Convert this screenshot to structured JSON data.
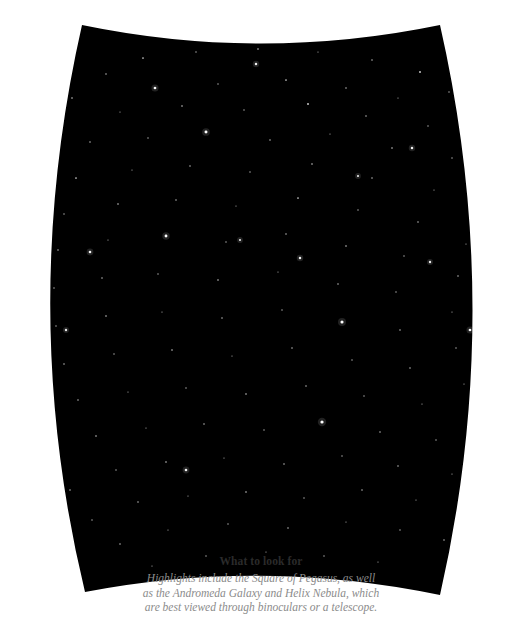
{
  "chart_data": {
    "type": "scatter",
    "title": "",
    "xlabel": "",
    "ylabel": "",
    "background_color": "#000000",
    "star_color": "#ffffff",
    "page_background": "#ffffff",
    "grid": false,
    "legend": "none",
    "projection_shape": "barrel",
    "xlim": [
      0,
      522
    ],
    "ylim": [
      0,
      623
    ],
    "stars": [
      {
        "x": 143,
        "y": 58,
        "mag": 1.4
      },
      {
        "x": 196,
        "y": 52,
        "mag": 1.1
      },
      {
        "x": 258,
        "y": 49,
        "mag": 1.3
      },
      {
        "x": 318,
        "y": 52,
        "mag": 1.0
      },
      {
        "x": 372,
        "y": 60,
        "mag": 1.2
      },
      {
        "x": 420,
        "y": 72,
        "mag": 1.5
      },
      {
        "x": 106,
        "y": 74,
        "mag": 1.2
      },
      {
        "x": 449,
        "y": 92,
        "mag": 1.1
      },
      {
        "x": 72,
        "y": 98,
        "mag": 1.3
      },
      {
        "x": 155,
        "y": 88,
        "mag": 2.2
      },
      {
        "x": 218,
        "y": 84,
        "mag": 1.1
      },
      {
        "x": 286,
        "y": 80,
        "mag": 1.4
      },
      {
        "x": 346,
        "y": 88,
        "mag": 1.2
      },
      {
        "x": 398,
        "y": 98,
        "mag": 1.0
      },
      {
        "x": 472,
        "y": 118,
        "mag": 1.2
      },
      {
        "x": 52,
        "y": 128,
        "mag": 1.1
      },
      {
        "x": 120,
        "y": 112,
        "mag": 1.0
      },
      {
        "x": 182,
        "y": 106,
        "mag": 1.3
      },
      {
        "x": 244,
        "y": 110,
        "mag": 1.1
      },
      {
        "x": 308,
        "y": 104,
        "mag": 1.5
      },
      {
        "x": 366,
        "y": 116,
        "mag": 1.2
      },
      {
        "x": 428,
        "y": 126,
        "mag": 1.1
      },
      {
        "x": 486,
        "y": 146,
        "mag": 1.0
      },
      {
        "x": 38,
        "y": 160,
        "mag": 1.3
      },
      {
        "x": 90,
        "y": 142,
        "mag": 1.2
      },
      {
        "x": 148,
        "y": 138,
        "mag": 1.1
      },
      {
        "x": 206,
        "y": 132,
        "mag": 2.4
      },
      {
        "x": 270,
        "y": 140,
        "mag": 1.2
      },
      {
        "x": 330,
        "y": 134,
        "mag": 1.0
      },
      {
        "x": 392,
        "y": 148,
        "mag": 1.3
      },
      {
        "x": 452,
        "y": 158,
        "mag": 1.1
      },
      {
        "x": 496,
        "y": 182,
        "mag": 1.2
      },
      {
        "x": 28,
        "y": 196,
        "mag": 1.1
      },
      {
        "x": 76,
        "y": 178,
        "mag": 1.4
      },
      {
        "x": 132,
        "y": 170,
        "mag": 1.0
      },
      {
        "x": 190,
        "y": 166,
        "mag": 1.2
      },
      {
        "x": 250,
        "y": 172,
        "mag": 1.1
      },
      {
        "x": 312,
        "y": 164,
        "mag": 1.3
      },
      {
        "x": 372,
        "y": 178,
        "mag": 1.2
      },
      {
        "x": 434,
        "y": 190,
        "mag": 1.0
      },
      {
        "x": 478,
        "y": 212,
        "mag": 1.1
      },
      {
        "x": 24,
        "y": 234,
        "mag": 1.2
      },
      {
        "x": 64,
        "y": 214,
        "mag": 1.1
      },
      {
        "x": 118,
        "y": 204,
        "mag": 1.3
      },
      {
        "x": 176,
        "y": 200,
        "mag": 1.2
      },
      {
        "x": 236,
        "y": 206,
        "mag": 1.0
      },
      {
        "x": 298,
        "y": 198,
        "mag": 1.4
      },
      {
        "x": 358,
        "y": 210,
        "mag": 1.1
      },
      {
        "x": 418,
        "y": 222,
        "mag": 1.2
      },
      {
        "x": 466,
        "y": 244,
        "mag": 1.0
      },
      {
        "x": 22,
        "y": 272,
        "mag": 1.1
      },
      {
        "x": 58,
        "y": 250,
        "mag": 1.2
      },
      {
        "x": 108,
        "y": 240,
        "mag": 1.0
      },
      {
        "x": 166,
        "y": 236,
        "mag": 2.3
      },
      {
        "x": 226,
        "y": 242,
        "mag": 1.1
      },
      {
        "x": 286,
        "y": 234,
        "mag": 1.2
      },
      {
        "x": 346,
        "y": 246,
        "mag": 1.3
      },
      {
        "x": 404,
        "y": 256,
        "mag": 1.1
      },
      {
        "x": 458,
        "y": 276,
        "mag": 1.2
      },
      {
        "x": 20,
        "y": 310,
        "mag": 1.0
      },
      {
        "x": 54,
        "y": 288,
        "mag": 1.1
      },
      {
        "x": 102,
        "y": 278,
        "mag": 1.2
      },
      {
        "x": 158,
        "y": 274,
        "mag": 1.1
      },
      {
        "x": 218,
        "y": 280,
        "mag": 1.3
      },
      {
        "x": 278,
        "y": 272,
        "mag": 1.0
      },
      {
        "x": 338,
        "y": 284,
        "mag": 1.2
      },
      {
        "x": 396,
        "y": 292,
        "mag": 1.1
      },
      {
        "x": 452,
        "y": 312,
        "mag": 1.0
      },
      {
        "x": 22,
        "y": 348,
        "mag": 1.2
      },
      {
        "x": 56,
        "y": 326,
        "mag": 1.1
      },
      {
        "x": 106,
        "y": 316,
        "mag": 1.3
      },
      {
        "x": 162,
        "y": 312,
        "mag": 1.0
      },
      {
        "x": 222,
        "y": 318,
        "mag": 1.2
      },
      {
        "x": 282,
        "y": 310,
        "mag": 1.1
      },
      {
        "x": 342,
        "y": 322,
        "mag": 2.5
      },
      {
        "x": 400,
        "y": 330,
        "mag": 1.2
      },
      {
        "x": 456,
        "y": 348,
        "mag": 1.1
      },
      {
        "x": 28,
        "y": 386,
        "mag": 1.0
      },
      {
        "x": 64,
        "y": 364,
        "mag": 1.2
      },
      {
        "x": 114,
        "y": 354,
        "mag": 1.1
      },
      {
        "x": 172,
        "y": 350,
        "mag": 1.3
      },
      {
        "x": 232,
        "y": 356,
        "mag": 1.0
      },
      {
        "x": 292,
        "y": 348,
        "mag": 1.2
      },
      {
        "x": 352,
        "y": 360,
        "mag": 1.1
      },
      {
        "x": 410,
        "y": 368,
        "mag": 1.2
      },
      {
        "x": 464,
        "y": 384,
        "mag": 1.0
      },
      {
        "x": 38,
        "y": 422,
        "mag": 1.1
      },
      {
        "x": 78,
        "y": 400,
        "mag": 1.2
      },
      {
        "x": 128,
        "y": 392,
        "mag": 1.0
      },
      {
        "x": 186,
        "y": 388,
        "mag": 1.1
      },
      {
        "x": 246,
        "y": 394,
        "mag": 1.3
      },
      {
        "x": 306,
        "y": 386,
        "mag": 1.2
      },
      {
        "x": 364,
        "y": 396,
        "mag": 1.1
      },
      {
        "x": 422,
        "y": 404,
        "mag": 1.0
      },
      {
        "x": 474,
        "y": 418,
        "mag": 1.2
      },
      {
        "x": 52,
        "y": 456,
        "mag": 1.1
      },
      {
        "x": 96,
        "y": 436,
        "mag": 1.3
      },
      {
        "x": 146,
        "y": 428,
        "mag": 1.0
      },
      {
        "x": 204,
        "y": 424,
        "mag": 1.2
      },
      {
        "x": 264,
        "y": 430,
        "mag": 1.1
      },
      {
        "x": 322,
        "y": 422,
        "mag": 2.6
      },
      {
        "x": 380,
        "y": 432,
        "mag": 1.2
      },
      {
        "x": 436,
        "y": 440,
        "mag": 1.1
      },
      {
        "x": 482,
        "y": 452,
        "mag": 1.0
      },
      {
        "x": 70,
        "y": 490,
        "mag": 1.2
      },
      {
        "x": 116,
        "y": 470,
        "mag": 1.1
      },
      {
        "x": 166,
        "y": 462,
        "mag": 1.3
      },
      {
        "x": 224,
        "y": 458,
        "mag": 1.0
      },
      {
        "x": 284,
        "y": 464,
        "mag": 1.2
      },
      {
        "x": 342,
        "y": 456,
        "mag": 1.1
      },
      {
        "x": 398,
        "y": 466,
        "mag": 1.2
      },
      {
        "x": 452,
        "y": 474,
        "mag": 1.0
      },
      {
        "x": 92,
        "y": 520,
        "mag": 1.1
      },
      {
        "x": 138,
        "y": 502,
        "mag": 1.2
      },
      {
        "x": 188,
        "y": 496,
        "mag": 1.0
      },
      {
        "x": 246,
        "y": 492,
        "mag": 1.3
      },
      {
        "x": 304,
        "y": 498,
        "mag": 1.1
      },
      {
        "x": 362,
        "y": 490,
        "mag": 1.2
      },
      {
        "x": 416,
        "y": 500,
        "mag": 1.0
      },
      {
        "x": 466,
        "y": 508,
        "mag": 1.1
      },
      {
        "x": 120,
        "y": 544,
        "mag": 1.2
      },
      {
        "x": 168,
        "y": 530,
        "mag": 1.0
      },
      {
        "x": 228,
        "y": 524,
        "mag": 1.1
      },
      {
        "x": 288,
        "y": 528,
        "mag": 1.2
      },
      {
        "x": 346,
        "y": 522,
        "mag": 1.0
      },
      {
        "x": 400,
        "y": 530,
        "mag": 1.1
      },
      {
        "x": 444,
        "y": 540,
        "mag": 1.2
      },
      {
        "x": 152,
        "y": 566,
        "mag": 1.0
      },
      {
        "x": 206,
        "y": 556,
        "mag": 1.1
      },
      {
        "x": 266,
        "y": 552,
        "mag": 1.0
      },
      {
        "x": 324,
        "y": 556,
        "mag": 1.1
      },
      {
        "x": 378,
        "y": 562,
        "mag": 1.0
      },
      {
        "x": 256,
        "y": 64,
        "mag": 2.0
      },
      {
        "x": 90,
        "y": 252,
        "mag": 2.1
      },
      {
        "x": 412,
        "y": 148,
        "mag": 2.0
      },
      {
        "x": 470,
        "y": 330,
        "mag": 2.2
      },
      {
        "x": 186,
        "y": 470,
        "mag": 2.1
      },
      {
        "x": 300,
        "y": 258,
        "mag": 2.0
      },
      {
        "x": 66,
        "y": 330,
        "mag": 1.9
      },
      {
        "x": 430,
        "y": 262,
        "mag": 1.9
      },
      {
        "x": 240,
        "y": 240,
        "mag": 1.8
      },
      {
        "x": 358,
        "y": 176,
        "mag": 1.8
      }
    ]
  },
  "caption": {
    "title": "What to look for",
    "lines": [
      "Highlights include the Square of Pegasus, as well",
      "as the Andromeda Galaxy and Helix Nebula, which",
      "are best viewed through binoculars or a telescope."
    ]
  }
}
